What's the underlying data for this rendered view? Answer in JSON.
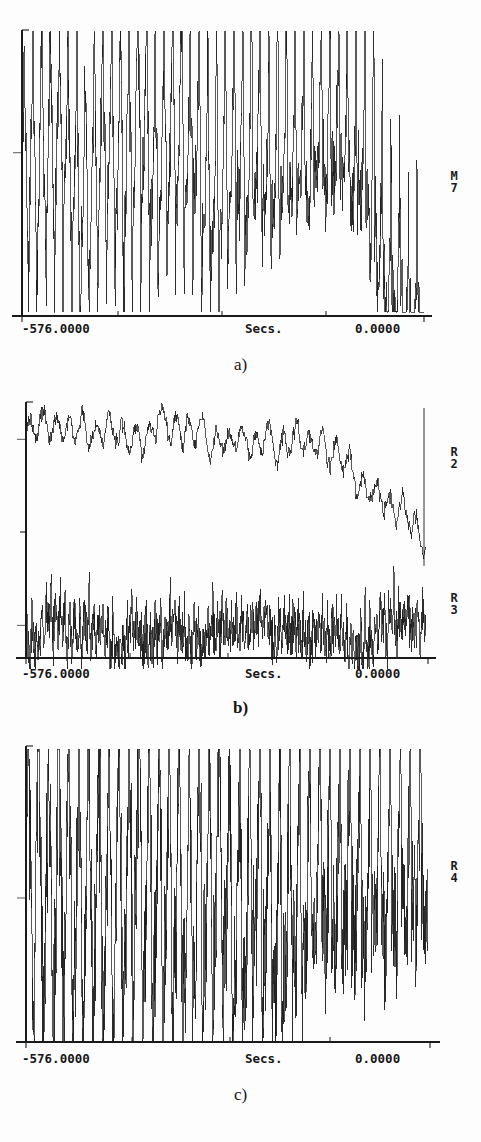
{
  "figure": {
    "title": "",
    "background_color": "#fdfdfd",
    "ink_color": "#1a1a1a",
    "width": 481,
    "height": 1142
  },
  "panels": [
    {
      "id": "panel-a",
      "caption": "a)",
      "x_axis": {
        "label": "Secs.",
        "left_tick_label": "-576.0000",
        "right_tick_label": "0.0000",
        "min": -576.0,
        "max": 0.0
      },
      "traces": [
        {
          "name": "M7",
          "label_lines": [
            "M",
            "7"
          ]
        }
      ]
    },
    {
      "id": "panel-b",
      "caption": "b)",
      "x_axis": {
        "label": "Secs.",
        "left_tick_label": "-576.0000",
        "right_tick_label": "0.0000",
        "min": -576.0,
        "max": 0.0
      },
      "traces": [
        {
          "name": "R2",
          "label_lines": [
            "R",
            "2"
          ]
        },
        {
          "name": "R3",
          "label_lines": [
            "R",
            "3"
          ]
        }
      ]
    },
    {
      "id": "panel-c",
      "caption": "c)",
      "x_axis": {
        "label": "Secs.",
        "left_tick_label": "-576.0000",
        "right_tick_label": "0.0000",
        "min": -576.0,
        "max": 0.0
      },
      "traces": [
        {
          "name": "R4",
          "label_lines": [
            "R",
            "4"
          ]
        }
      ]
    }
  ],
  "chart_data": {
    "type": "line",
    "title": "",
    "xlabel": "Secs.",
    "ylabel": "",
    "xlim": [
      -576.0,
      0.0
    ],
    "grid": false,
    "legend": "right-of-axes, stacked letter/number",
    "x_tick_labels": [
      "-576.0000",
      "0.0000"
    ],
    "subplots": [
      {
        "caption": "a)",
        "series": [
          {
            "name": "M7",
            "description": "Dense high-frequency oscillating trace with repeated sharp up-down cycles across full record; amplitude roughly constant from -576 s to about -120 s, then mean level collapses downward toward the end of the record near 0 s with deep excursions reaching the axis floor.",
            "seed": 1741,
            "baseline": 0.58,
            "amplitude": 0.36,
            "cycles": 46,
            "noise": 0.2,
            "decay_start": 0.78,
            "decay_depth": 0.72,
            "spikiness": 0.85
          }
        ]
      },
      {
        "caption": "b)",
        "series": [
          {
            "name": "R2",
            "description": "Upper trace: noisy but smooth envelope, slight rise to a broad plateau near the middle of the record, then a marked monotonic decline over the last fifth with a final vertical recovery spike at 0 s.",
            "seed": 907,
            "baseline": 0.8,
            "amplitude": 0.07,
            "cycles": 30,
            "noise": 0.05,
            "decay_start": 0.74,
            "decay_depth": 0.62,
            "spikiness": 0.18
          },
          {
            "name": "R3",
            "description": "Lower trace: low-amplitude baseline with dense narrow upward spikes of varying height occurring throughout the record, no overall trend.",
            "seed": 3312,
            "baseline": 0.22,
            "amplitude": 0.1,
            "cycles": 84,
            "noise": 0.34,
            "decay_start": 1.0,
            "decay_depth": 0.0,
            "spikiness": 0.95
          }
        ]
      },
      {
        "caption": "c)",
        "series": [
          {
            "name": "R4",
            "description": "Very spiky quasi-periodic trace: tall narrow positive spikes paired with deep negative excursions, repeating about 40 times across the record, rising in overall amplitude toward 0 s.",
            "seed": 5521,
            "baseline": 0.52,
            "amplitude": 0.44,
            "cycles": 40,
            "noise": 0.4,
            "decay_start": 1.0,
            "decay_depth": 0.0,
            "spikiness": 1.0
          }
        ]
      }
    ]
  }
}
